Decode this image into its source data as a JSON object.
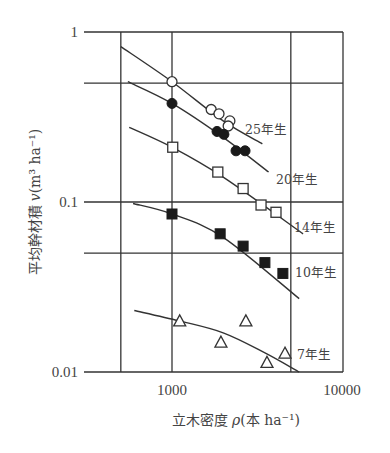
{
  "chart_data": {
    "type": "scatter",
    "title": "",
    "xlabel": "立木密度 ρ(本 ha⁻¹)",
    "ylabel": "平均幹材積 v(m³ ha⁻¹)",
    "xscale": "log",
    "yscale": "log",
    "xlim": [
      500,
      10000
    ],
    "ylim": [
      0.01,
      1
    ],
    "x_ticks": [
      1000,
      10000
    ],
    "x_tick_labels": [
      "1000",
      "10000"
    ],
    "y_ticks": [
      0.01,
      0.1,
      1
    ],
    "y_tick_labels": [
      "0.01",
      "0.1",
      "1"
    ],
    "grid": {
      "x": [
        500,
        1000,
        5000
      ],
      "y": [
        0.05,
        0.1,
        0.5
      ]
    },
    "legend": "inline labels",
    "series": [
      {
        "name": "25年生",
        "marker": "open-circle",
        "x": [
          1000,
          1700,
          1890,
          2190,
          2140
        ],
        "y": [
          0.51,
          0.35,
          0.33,
          0.3,
          0.28
        ],
        "fit": {
          "x": [
            500,
            1000,
            2000,
            3400
          ],
          "y": [
            0.82,
            0.51,
            0.3,
            0.22
          ]
        }
      },
      {
        "name": "20年生",
        "marker": "filled-circle",
        "x": [
          1000,
          1840,
          2020,
          2380,
          2690
        ],
        "y": [
          0.38,
          0.26,
          0.25,
          0.2,
          0.2
        ],
        "fit": {
          "x": [
            550,
            1000,
            2000,
            3700
          ],
          "y": [
            0.51,
            0.38,
            0.24,
            0.15
          ]
        }
      },
      {
        "name": "14年生",
        "marker": "open-square",
        "x": [
          1010,
          1860,
          2620,
          3340,
          4090
        ],
        "y": [
          0.21,
          0.15,
          0.12,
          0.096,
          0.087
        ],
        "fit": {
          "x": [
            560,
            1000,
            2000,
            5900
          ],
          "y": [
            0.275,
            0.21,
            0.14,
            0.065
          ]
        }
      },
      {
        "name": "10年生",
        "marker": "filled-square",
        "x": [
          1000,
          1920,
          2620,
          3520,
          4490
        ],
        "y": [
          0.085,
          0.065,
          0.055,
          0.044,
          0.038
        ],
        "fit": {
          "x": [
            590,
            1000,
            2000,
            5600
          ],
          "y": [
            0.098,
            0.085,
            0.062,
            0.027
          ]
        }
      },
      {
        "name": "7年生",
        "marker": "open-triangle",
        "x": [
          1110,
          1940,
          2720,
          3620,
          4620
        ],
        "y": [
          0.02,
          0.015,
          0.02,
          0.0114,
          0.0129
        ],
        "fit": {
          "x": [
            600,
            1100,
            2000,
            3500,
            5600
          ],
          "y": [
            0.023,
            0.02,
            0.017,
            0.013,
            0.01
          ]
        }
      }
    ]
  },
  "labels": {
    "y_axis_title_main": "平均幹材積",
    "y_axis_title_var": "v",
    "y_axis_title_unit": "(m³ ha⁻¹)",
    "x_axis_title_main": "立木密度",
    "x_axis_title_var": "ρ",
    "x_axis_title_unit": "(本 ha⁻¹)"
  }
}
